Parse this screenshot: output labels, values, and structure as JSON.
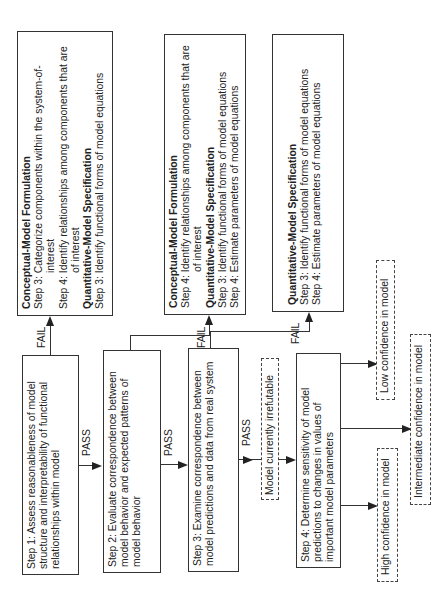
{
  "steps": [
    {
      "label": "Step 1:  Assess reasonableness of model structure and interpretability of functional relationships within model"
    },
    {
      "label": "Step 2:  Evaluate correspondence between model behavior and expected patterns of model behavior"
    },
    {
      "label": "Step 3:  Examine correspondence between model predictions and data from real system"
    },
    {
      "label": "Step 4:  Determine sensitivity of model predictions to changes in values of important model parameters"
    }
  ],
  "transitions": {
    "pass": "PASS",
    "fail": "FAIL"
  },
  "fail_boxes": [
    {
      "sections": [
        {
          "header": "Conceptual-Model Formulation",
          "items": [
            "Step 3:  Categorize components within the system-of-interest",
            "Step 4:  Identify relationships among components that are of interest"
          ]
        },
        {
          "header": "Quantitative-Model Specification",
          "items": [
            "Step 3:  Identify functional forms of model equations"
          ]
        }
      ]
    },
    {
      "sections": [
        {
          "header": "Conceptual-Model Formulation",
          "items": [
            "Step 4:  Identify relationships among components that are of interest"
          ]
        },
        {
          "header": "Quantitative-Model Specification",
          "items": [
            "Step 3:  Identify functional forms of model equations",
            "Step 4:  Estimate parameters of model equations"
          ]
        }
      ]
    },
    {
      "sections": [
        {
          "header": "Quantitative-Model Specification",
          "items": [
            "Step 3:  Identify functional forms of model equations",
            "Step 4:  Estimate parameters of model equations"
          ]
        }
      ]
    }
  ],
  "outcomes": {
    "irrefutable": "Model currently irrefutable",
    "low": "Low confidence in model",
    "intermediate": "Intermediate confidence in model",
    "high": "High confidence in model"
  }
}
